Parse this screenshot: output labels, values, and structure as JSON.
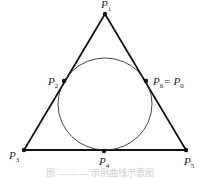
{
  "diagram": {
    "type": "geometry",
    "colors": {
      "stroke": "#111111",
      "circle": "#333333",
      "background": "#ffffff"
    },
    "triangle": {
      "vertices": [
        "P1",
        "P3",
        "P5"
      ]
    },
    "points": [
      {
        "id": "P1",
        "label": "P",
        "sub": "1",
        "x": 105,
        "y": 14
      },
      {
        "id": "P2",
        "label": "P",
        "sub": "2",
        "x": 64,
        "y": 81
      },
      {
        "id": "P3",
        "label": "P",
        "sub": "3",
        "x": 24,
        "y": 150
      },
      {
        "id": "P4",
        "label": "P",
        "sub": "4",
        "x": 104,
        "y": 151
      },
      {
        "id": "P5",
        "label": "P",
        "sub": "5",
        "x": 186,
        "y": 150
      },
      {
        "id": "P6",
        "label": "P",
        "sub": "6",
        "x": 146,
        "y": 81
      }
    ],
    "labels": {
      "p1": "P",
      "p1_sub": "1",
      "p2": "P",
      "p2_sub": "2",
      "p3": "P",
      "p3_sub": "3",
      "p4": "P",
      "p4_sub": "4",
      "p5": "P",
      "p5_sub": "5",
      "p6": "P",
      "p6_sub": "6",
      "eq": "= ",
      "p0": "P",
      "p0_sub": "0"
    },
    "caption": "图 — — — 示例曲线示意图"
  }
}
